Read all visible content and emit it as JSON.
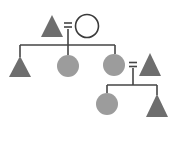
{
  "diagram": {
    "type": "kinship-chart",
    "colors": {
      "male_fill": "#6e6e6e",
      "female_fill": "#9c9c9c",
      "ego_fill": "#ffffff",
      "ego_stroke": "#3a3a3a",
      "line": "#454545"
    },
    "nodes": [
      {
        "id": "g1-male",
        "shape": "triangle",
        "sex": "male",
        "generation": 1,
        "x": 52,
        "y": 26
      },
      {
        "id": "g1-female",
        "shape": "circle",
        "sex": "female",
        "generation": 1,
        "x": 87,
        "y": 26,
        "highlight": "outline"
      },
      {
        "id": "g2-son",
        "shape": "triangle",
        "sex": "male",
        "generation": 2,
        "x": 20,
        "y": 67
      },
      {
        "id": "g2-daughter-1",
        "shape": "circle",
        "sex": "female",
        "generation": 2,
        "x": 68,
        "y": 66
      },
      {
        "id": "g2-daughter-2",
        "shape": "circle",
        "sex": "female",
        "generation": 2,
        "x": 114,
        "y": 65
      },
      {
        "id": "g2-spouse",
        "shape": "triangle",
        "sex": "male",
        "generation": 2,
        "x": 150,
        "y": 65
      },
      {
        "id": "g3-daughter",
        "shape": "circle",
        "sex": "female",
        "generation": 3,
        "x": 107,
        "y": 104
      },
      {
        "id": "g3-son",
        "shape": "triangle",
        "sex": "male",
        "generation": 3,
        "x": 157,
        "y": 106
      }
    ],
    "relations": [
      {
        "type": "marriage",
        "symbol": "=",
        "between": [
          "g1-male",
          "g1-female"
        ]
      },
      {
        "type": "marriage",
        "symbol": "=",
        "between": [
          "g2-daughter-2",
          "g2-spouse"
        ]
      },
      {
        "type": "descent",
        "parents": [
          "g1-male",
          "g1-female"
        ],
        "children": [
          "g2-son",
          "g2-daughter-1",
          "g2-daughter-2"
        ]
      },
      {
        "type": "descent",
        "parents": [
          "g2-daughter-2",
          "g2-spouse"
        ],
        "children": [
          "g3-daughter",
          "g3-son"
        ]
      }
    ]
  }
}
